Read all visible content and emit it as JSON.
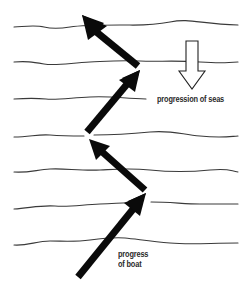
{
  "diagram": {
    "labels": {
      "seas": "progression of seas",
      "boat_line1": "progress",
      "boat_line2": "of boat"
    },
    "colors": {
      "background": "#ffffff",
      "wave_line": "#3a3a3a",
      "arrow_fill": "#0a0a0a",
      "hollow_arrow_stroke": "#222222",
      "text": "#2a2a2a"
    },
    "wave_lines": [
      {
        "y": 27,
        "x_start": 14,
        "x_end": 238
      },
      {
        "y": 62,
        "x_start": 14,
        "x_end": 238
      },
      {
        "y": 99,
        "x_start": 14,
        "x_end": 146
      },
      {
        "y": 136,
        "x_start": 14,
        "x_end": 238
      },
      {
        "y": 172,
        "x_start": 14,
        "x_end": 238
      },
      {
        "y": 208,
        "x_start": 14,
        "x_end": 238
      },
      {
        "y": 244,
        "x_start": 14,
        "x_end": 238
      }
    ],
    "boat_arrows": [
      {
        "from": [
          78,
          277
        ],
        "to": [
          146,
          194
        ]
      },
      {
        "from": [
          145,
          190
        ],
        "to": [
          89,
          139
        ]
      },
      {
        "from": [
          87,
          133
        ],
        "to": [
          140,
          70
        ]
      },
      {
        "from": [
          138,
          66
        ],
        "to": [
          82,
          15
        ]
      }
    ],
    "seas_arrow": {
      "direction": "down",
      "x": 192,
      "y_top": 40,
      "y_bottom": 89
    }
  }
}
